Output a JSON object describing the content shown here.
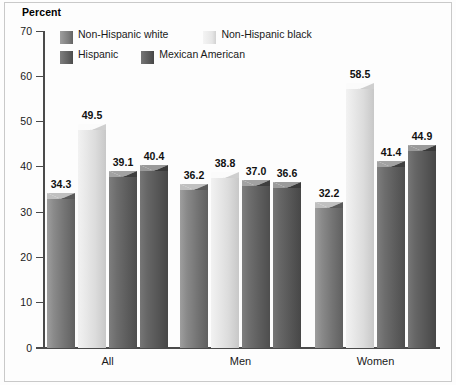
{
  "chart_data": {
    "type": "bar",
    "title": "",
    "ylabel": "Percent",
    "xlabel": "",
    "categories": [
      "All",
      "Men",
      "Women"
    ],
    "ylim": [
      0,
      70
    ],
    "yticks": [
      0,
      10,
      20,
      30,
      40,
      50,
      60,
      70
    ],
    "grid": false,
    "legend_position": "top-left-inside",
    "series": [
      {
        "name": "Non-Hispanic white",
        "values": [
          34.3,
          36.2,
          32.2
        ],
        "color": "#7a7a7a"
      },
      {
        "name": "Non-Hispanic black",
        "values": [
          49.5,
          38.8,
          58.5
        ],
        "color": "#e6e6e6"
      },
      {
        "name": "Hispanic",
        "values": [
          39.1,
          37.0,
          41.4
        ],
        "color": "#5d5d5d"
      },
      {
        "name": "Mexican American",
        "values": [
          40.4,
          36.6,
          44.9
        ],
        "color": "#565656"
      }
    ],
    "data_labels": [
      [
        "34.3",
        "49.5",
        "39.1",
        "40.4"
      ],
      [
        "36.2",
        "38.8",
        "37.0",
        "36.6"
      ],
      [
        "32.2",
        "58.5",
        "41.4",
        "44.9"
      ]
    ]
  },
  "axis": {
    "title": "Percent",
    "tick_labels": [
      "70",
      "60",
      "50",
      "40",
      "30",
      "20",
      "10",
      "0"
    ]
  },
  "legend": {
    "items": [
      {
        "label": "Non-Hispanic white"
      },
      {
        "label": "Non-Hispanic black"
      },
      {
        "label": "Hispanic"
      },
      {
        "label": "Mexican American"
      }
    ]
  }
}
